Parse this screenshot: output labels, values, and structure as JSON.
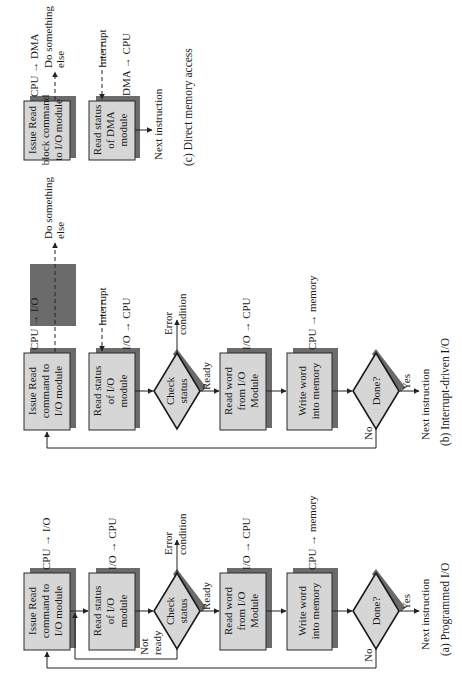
{
  "figure": {
    "panels": {
      "c": {
        "caption": "(c) Direct memory access",
        "box1": [
          "Issue Read",
          "block command",
          "to I/O module"
        ],
        "box1_label": "CPU → DMA",
        "box1_side": [
          "Do something",
          "else"
        ],
        "box2": [
          "Read status",
          "of DMA",
          "module"
        ],
        "box2_interrupt": "Interrupt",
        "box2_label": "DMA → CPU",
        "next": "Next instruction"
      },
      "b": {
        "caption": "(b) Interrupt-driven I/O",
        "box1": [
          "Issue Read",
          "command to",
          "I/O module"
        ],
        "box1_label": "CPU → I/O",
        "box1_side": [
          "Do something",
          "else"
        ],
        "box2": [
          "Read status",
          "of I/O",
          "module"
        ],
        "box2_interrupt": "Interrupt",
        "box2_label": "I/O → CPU",
        "check": [
          "Check",
          "status"
        ],
        "error": [
          "Error",
          "condition"
        ],
        "ready": "Ready",
        "box4": [
          "Read word",
          "from I/O",
          "Module"
        ],
        "box4_label": "I/O → CPU",
        "box5": [
          "Write word",
          "into memory"
        ],
        "box5_label": "CPU → memory",
        "done": "Done?",
        "yes": "Yes",
        "no": "No",
        "next": "Next instruction"
      },
      "a": {
        "caption": "(a) Programmed I/O",
        "box1": [
          "Issue Read",
          "command to",
          "I/O module"
        ],
        "box1_label": "CPU → I/O",
        "box2": [
          "Read status",
          "of I/O",
          "module"
        ],
        "box2_label": "I/O → CPU",
        "check": [
          "Check",
          "status"
        ],
        "error": [
          "Error",
          "condition"
        ],
        "ready": "Ready",
        "not_ready": [
          "Not",
          "ready"
        ],
        "box4": [
          "Read word",
          "from I/O",
          "Module"
        ],
        "box4_label": "I/O → CPU",
        "box5": [
          "Write word",
          "into memory"
        ],
        "box5_label": "CPU → memory",
        "done": "Done?",
        "yes": "Yes",
        "no": "No",
        "next": "Next instruction"
      }
    }
  }
}
